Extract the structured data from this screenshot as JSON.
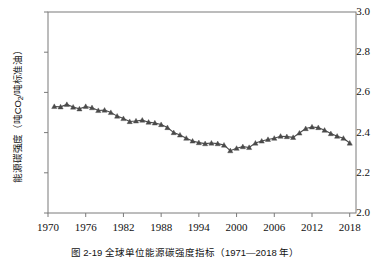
{
  "chart_data": {
    "type": "line",
    "title": "",
    "caption": "图 2-19  全球单位能源碳强度指标（1971—2018 年）",
    "xlabel": "",
    "ylabel": "能源碳强度（吨CO₂/吨标准油）",
    "ylabel_main": "能源碳强度（吨CO",
    "ylabel_sub": "2",
    "ylabel_tail": "/吨标准油）",
    "xlim": [
      1970,
      2019
    ],
    "ylim": [
      2.0,
      3.0
    ],
    "yticks": [
      "3.0",
      "2.8",
      "2.6",
      "2.4",
      "2.2",
      "2.0"
    ],
    "ytick_values": [
      3.0,
      2.8,
      2.6,
      2.4,
      2.2,
      2.0
    ],
    "xticks": [
      "1970",
      "1976",
      "1982",
      "1988",
      "1994",
      "2000",
      "2006",
      "2012",
      "2018"
    ],
    "xtick_values": [
      1970,
      1976,
      1982,
      1988,
      1994,
      2000,
      2006,
      2012,
      2018
    ],
    "grid": false,
    "legend": "none",
    "marker": "triangle-up",
    "series_color": "#4a4a4a",
    "axis_color": "#7a7a7a",
    "series": [
      {
        "name": "全球单位能源碳强度",
        "x": [
          1971,
          1972,
          1973,
          1974,
          1975,
          1976,
          1977,
          1978,
          1979,
          1980,
          1981,
          1982,
          1983,
          1984,
          1985,
          1986,
          1987,
          1988,
          1989,
          1990,
          1991,
          1992,
          1993,
          1994,
          1995,
          1996,
          1997,
          1998,
          1999,
          2000,
          2001,
          2002,
          2003,
          2004,
          2005,
          2006,
          2007,
          2008,
          2009,
          2010,
          2011,
          2012,
          2013,
          2014,
          2015,
          2016,
          2017,
          2018
        ],
        "values": [
          2.53,
          2.528,
          2.54,
          2.527,
          2.518,
          2.53,
          2.524,
          2.51,
          2.512,
          2.5,
          2.482,
          2.47,
          2.455,
          2.458,
          2.462,
          2.452,
          2.448,
          2.44,
          2.425,
          2.4,
          2.388,
          2.372,
          2.358,
          2.35,
          2.345,
          2.348,
          2.345,
          2.338,
          2.31,
          2.322,
          2.33,
          2.326,
          2.348,
          2.358,
          2.366,
          2.372,
          2.382,
          2.38,
          2.376,
          2.398,
          2.42,
          2.428,
          2.425,
          2.412,
          2.395,
          2.382,
          2.372,
          2.348
        ]
      }
    ]
  }
}
